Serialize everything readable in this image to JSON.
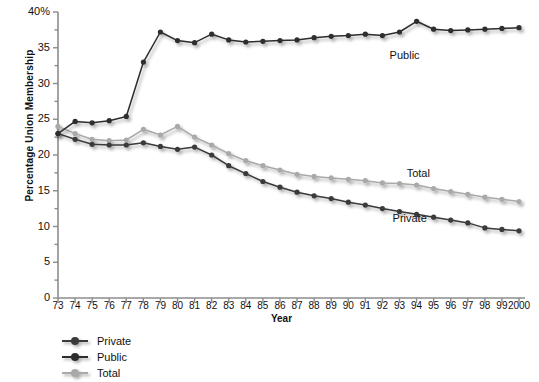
{
  "chart_data": {
    "type": "line",
    "title": "",
    "xlabel": "Year",
    "ylabel": "Percentage Union Membership",
    "xlim": [
      1973,
      2000
    ],
    "ylim": [
      0,
      40
    ],
    "ytick_values": [
      0,
      5,
      10,
      15,
      20,
      25,
      30,
      35,
      40
    ],
    "ytick_labels": [
      "0",
      "5",
      "10",
      "15",
      "20",
      "25",
      "30",
      "35",
      "40%"
    ],
    "yminor_step": 2.5,
    "grid": false,
    "legend_position": "below-left",
    "categories": [
      "73",
      "74",
      "75",
      "76",
      "77",
      "78",
      "79",
      "80",
      "81",
      "82",
      "83",
      "84",
      "85",
      "86",
      "87",
      "88",
      "89",
      "90",
      "91",
      "92",
      "93",
      "94",
      "95",
      "96",
      "97",
      "98",
      "99",
      "2000"
    ],
    "x": [
      1973,
      1974,
      1975,
      1976,
      1977,
      1978,
      1979,
      1980,
      1981,
      1982,
      1983,
      1984,
      1985,
      1986,
      1987,
      1988,
      1989,
      1990,
      1991,
      1992,
      1993,
      1994,
      1995,
      1996,
      1997,
      1998,
      1999,
      2000
    ],
    "series": [
      {
        "name": "Private",
        "color": "#3a3a3a",
        "marker": "circle",
        "values": [
          23.0,
          22.2,
          21.5,
          21.4,
          21.4,
          21.7,
          21.2,
          20.8,
          21.1,
          20.0,
          18.5,
          17.4,
          16.3,
          15.5,
          14.8,
          14.3,
          13.9,
          13.4,
          13.0,
          12.5,
          12.1,
          11.7,
          11.3,
          10.9,
          10.5,
          9.8,
          9.6,
          9.4
        ]
      },
      {
        "name": "Public",
        "color": "#2d2d2d",
        "marker": "circle",
        "values": [
          23.0,
          24.7,
          24.5,
          24.8,
          25.4,
          33.0,
          37.2,
          36.0,
          35.7,
          36.9,
          36.1,
          35.8,
          35.9,
          36.0,
          36.1,
          36.4,
          36.6,
          36.7,
          36.9,
          36.7,
          37.2,
          38.7,
          37.6,
          37.4,
          37.5,
          37.6,
          37.7,
          37.8
        ]
      },
      {
        "name": "Total",
        "color": "#a9a9a9",
        "marker": "circle",
        "values": [
          24.0,
          23.0,
          22.2,
          22.0,
          22.1,
          23.6,
          22.8,
          24.0,
          22.5,
          21.4,
          20.2,
          19.2,
          18.5,
          17.9,
          17.3,
          17.0,
          16.8,
          16.6,
          16.4,
          16.1,
          16.0,
          15.8,
          15.3,
          14.9,
          14.5,
          14.1,
          13.8,
          13.5
        ]
      }
    ],
    "annotations": [
      {
        "text": "Public",
        "x": 1993.3,
        "y": 33.4
      },
      {
        "text": "Total",
        "x": 1994.1,
        "y": 16.9
      },
      {
        "text": "Private",
        "x": 1993.6,
        "y": 10.7
      }
    ]
  },
  "legend": {
    "items": [
      {
        "label": "Private",
        "color": "#3a3a3a"
      },
      {
        "label": "Public",
        "color": "#2d2d2d"
      },
      {
        "label": "Total",
        "color": "#a9a9a9"
      }
    ]
  }
}
